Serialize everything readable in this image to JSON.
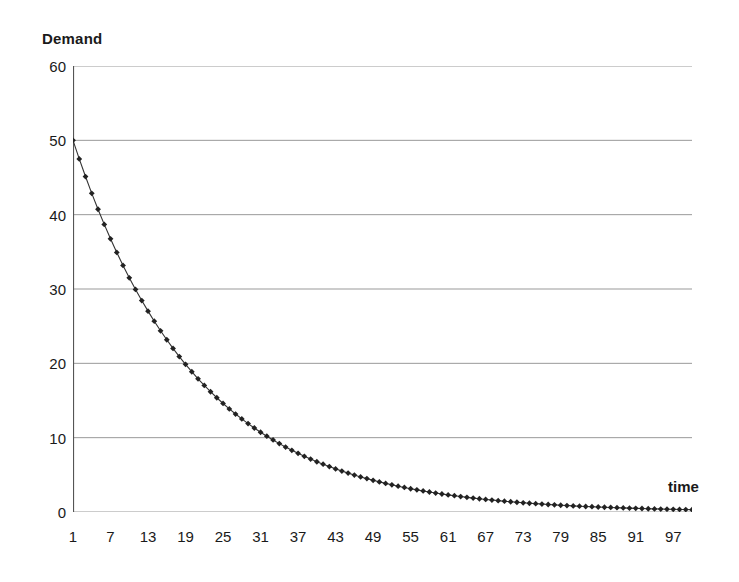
{
  "chart_data": {
    "type": "line",
    "title": "",
    "xlabel": "time",
    "ylabel": "Demand",
    "ylim": [
      0,
      60
    ],
    "xlim": [
      1,
      100
    ],
    "grid": true,
    "legend": false,
    "marker": "diamond",
    "line_color": "#333333",
    "marker_color": "#222222",
    "grid_color": "#999999",
    "axis_color": "#555555",
    "y_ticks": [
      0,
      10,
      20,
      30,
      40,
      50,
      60
    ],
    "x_tick_labels": [
      1,
      7,
      13,
      19,
      25,
      31,
      37,
      43,
      49,
      55,
      61,
      67,
      73,
      79,
      85,
      91,
      97
    ],
    "x_tick_step": 6,
    "x_minor_tick_count": 100,
    "series_name": "Demand",
    "x": [
      1,
      2,
      3,
      4,
      5,
      6,
      7,
      8,
      9,
      10,
      11,
      12,
      13,
      14,
      15,
      16,
      17,
      18,
      19,
      20,
      21,
      22,
      23,
      24,
      25,
      26,
      27,
      28,
      29,
      30,
      31,
      32,
      33,
      34,
      35,
      36,
      37,
      38,
      39,
      40,
      41,
      42,
      43,
      44,
      45,
      46,
      47,
      48,
      49,
      50,
      51,
      52,
      53,
      54,
      55,
      56,
      57,
      58,
      59,
      60,
      61,
      62,
      63,
      64,
      65,
      66,
      67,
      68,
      69,
      70,
      71,
      72,
      73,
      74,
      75,
      76,
      77,
      78,
      79,
      80,
      81,
      82,
      83,
      84,
      85,
      86,
      87,
      88,
      89,
      90,
      91,
      92,
      93,
      94,
      95,
      96,
      97,
      98,
      99,
      100
    ],
    "values": [
      50.0,
      47.5,
      45.13,
      42.87,
      40.73,
      38.69,
      36.75,
      34.92,
      33.17,
      31.51,
      29.94,
      28.44,
      27.02,
      25.67,
      24.38,
      23.17,
      22.01,
      20.91,
      19.86,
      18.87,
      17.92,
      17.03,
      16.18,
      15.37,
      14.6,
      13.87,
      13.18,
      12.52,
      11.89,
      11.3,
      10.73,
      10.2,
      9.69,
      9.2,
      8.74,
      8.3,
      7.89,
      7.49,
      7.12,
      6.76,
      6.43,
      6.11,
      5.8,
      5.51,
      5.23,
      4.97,
      4.72,
      4.49,
      4.26,
      4.05,
      3.85,
      3.66,
      3.47,
      3.3,
      3.13,
      2.98,
      2.83,
      2.69,
      2.55,
      2.42,
      2.3,
      2.19,
      2.08,
      1.97,
      1.87,
      1.78,
      1.69,
      1.61,
      1.53,
      1.45,
      1.38,
      1.31,
      1.24,
      1.18,
      1.12,
      1.07,
      1.01,
      0.96,
      0.91,
      0.87,
      0.82,
      0.78,
      0.74,
      0.71,
      0.67,
      0.64,
      0.61,
      0.58,
      0.55,
      0.52,
      0.49,
      0.47,
      0.44,
      0.42,
      0.4,
      0.38,
      0.36,
      0.34,
      0.33,
      0.31
    ],
    "model": "exponential decay: 50 * 0.95^(t-1)"
  }
}
